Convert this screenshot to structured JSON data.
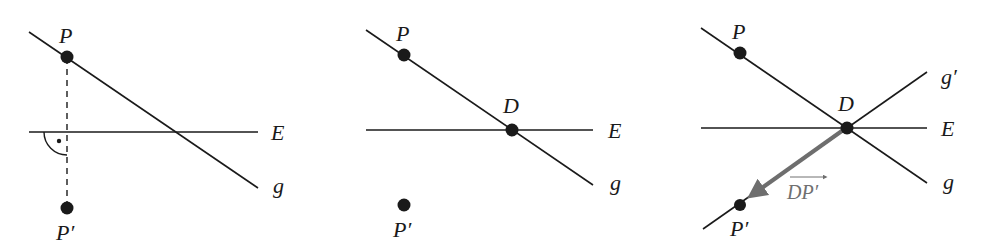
{
  "colors": {
    "line": "#1a1a1a",
    "arrow": "#6e6e6e",
    "background": "#ffffff"
  },
  "panels": [
    {
      "id": "panel-1",
      "description": "Orthogonal projection of P onto plane E",
      "labels": {
        "P": "P",
        "E": "E",
        "g": "g",
        "P_prime": "P′"
      }
    },
    {
      "id": "panel-2",
      "description": "Line g intersects plane E at D",
      "labels": {
        "P": "P",
        "D": "D",
        "E": "E",
        "g": "g",
        "P_prime": "P′"
      }
    },
    {
      "id": "panel-3",
      "description": "Reflected line g' through D and P' with vector DP'",
      "labels": {
        "P": "P",
        "D": "D",
        "E": "E",
        "g": "g",
        "g_prime": "g′",
        "vector": "DP′",
        "P_prime": "P′"
      }
    }
  ]
}
